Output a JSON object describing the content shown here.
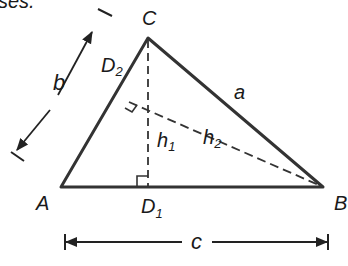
{
  "caption_fragment": "ses.",
  "diagram": {
    "type": "triangle-altitudes",
    "vertices": {
      "A": {
        "label": "A",
        "x": 61,
        "y": 187
      },
      "B": {
        "label": "B",
        "x": 323,
        "y": 187
      },
      "C": {
        "label": "C",
        "x": 148,
        "y": 38
      }
    },
    "feet": {
      "D1": {
        "label": "D",
        "sub": "1",
        "x": 148,
        "y": 187
      },
      "D2": {
        "label": "D",
        "sub": "2",
        "x": 129,
        "y": 102
      }
    },
    "sides": {
      "a": {
        "label": "a"
      },
      "b": {
        "label": "b"
      },
      "c": {
        "label": "c"
      }
    },
    "altitudes": {
      "h1": {
        "label": "h",
        "sub": "1"
      },
      "h2": {
        "label": "h",
        "sub": "2"
      }
    },
    "colors": {
      "stroke": "#333333",
      "text": "#1a1a1a"
    }
  }
}
